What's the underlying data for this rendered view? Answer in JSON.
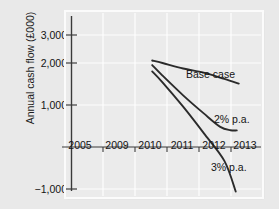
{
  "chart_data": {
    "type": "line",
    "title": "",
    "subtitle": "",
    "xlabel": "",
    "ylabel": "Annual cash flow (£000)",
    "x": [
      2005,
      2009,
      2010,
      2011,
      2012,
      2013
    ],
    "xtick_labels": [
      "2005",
      "2009",
      "2010",
      "2011",
      "2012",
      "2013"
    ],
    "ytick_labels": [
      "3,000",
      "2,000",
      "1,000",
      "−1,000"
    ],
    "ytick_values": [
      3000,
      2000,
      1000,
      -1000
    ],
    "ylim": [
      -1400,
      3300
    ],
    "xlim": [
      2005,
      2013.6
    ],
    "grid": true,
    "legend_position": "inline-annotations",
    "zero_line": 0,
    "series": [
      {
        "name": "Base case",
        "label": "Base case",
        "label_x": 2011.6,
        "label_y": 1900,
        "color": "#2b2b2b",
        "points": [
          {
            "x": 2008.5,
            "y": 2060
          },
          {
            "x": 2009.0,
            "y": 2000
          },
          {
            "x": 2010.0,
            "y": 1870
          },
          {
            "x": 2011.0,
            "y": 1770
          },
          {
            "x": 2012.0,
            "y": 1620
          },
          {
            "x": 2012.7,
            "y": 1510
          }
        ]
      },
      {
        "name": "2% p.a.",
        "label": "2% p.a.",
        "label_x": 2012.45,
        "label_y": 620,
        "color": "#2b2b2b",
        "points": [
          {
            "x": 2008.5,
            "y": 1950
          },
          {
            "x": 2009.0,
            "y": 1700
          },
          {
            "x": 2010.0,
            "y": 1230
          },
          {
            "x": 2011.0,
            "y": 800
          },
          {
            "x": 2011.8,
            "y": 480
          },
          {
            "x": 2012.3,
            "y": 400
          },
          {
            "x": 2012.6,
            "y": 395
          }
        ]
      },
      {
        "name": "3% p.a.",
        "label": "3% p.a.",
        "label_x": 2012.35,
        "label_y": -670,
        "color": "#2b2b2b",
        "points": [
          {
            "x": 2008.5,
            "y": 1800
          },
          {
            "x": 2009.0,
            "y": 1540
          },
          {
            "x": 2010.0,
            "y": 960
          },
          {
            "x": 2011.0,
            "y": 330
          },
          {
            "x": 2012.0,
            "y": -330
          },
          {
            "x": 2012.55,
            "y": -1060
          }
        ]
      }
    ]
  }
}
